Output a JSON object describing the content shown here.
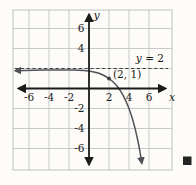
{
  "figure": {
    "asymptote_label_var": "y",
    "asymptote_label_eq": "= 2",
    "end_marker_icon": "black-square"
  },
  "colors": {
    "background": "#fdfcf9",
    "grid": "#c8c9cc",
    "axis": "#1b1b1b",
    "curve": "#515257",
    "asymptote": "#3c3c3c",
    "end_marker": "#242424"
  },
  "chart_data": {
    "type": "line",
    "title": "",
    "xlabel": "x",
    "ylabel": "y",
    "xlim": [
      -7.6,
      8.3
    ],
    "ylim": [
      -8.2,
      7.9
    ],
    "grid": true,
    "grid_step": 2,
    "x_ticks": [
      -6,
      -4,
      -2,
      2,
      4,
      6
    ],
    "y_ticks": [
      6,
      4,
      -2,
      -4,
      -6
    ],
    "asymptote": {
      "y": 2,
      "style": "dashed",
      "label": "y = 2"
    },
    "marked_point": {
      "x": 2,
      "y": 1,
      "label": "(2, 1)"
    },
    "series": [
      {
        "name": "curve",
        "description": "decreasing exponential-type curve, horizontal asymptote y = 2 on the left, through (2, 1), x-intercept near x = 3, arrow down near (5.3, -7.5)",
        "points": [
          [
            -7.35,
            1.78
          ],
          [
            -6.5,
            1.8
          ],
          [
            -5.5,
            1.82
          ],
          [
            -4.5,
            1.84
          ],
          [
            -3.5,
            1.85
          ],
          [
            -2.5,
            1.86
          ],
          [
            -1.5,
            1.84
          ],
          [
            -1,
            1.82
          ],
          [
            -0.5,
            1.79
          ],
          [
            0,
            1.74
          ],
          [
            0.5,
            1.65
          ],
          [
            1,
            1.52
          ],
          [
            1.5,
            1.3
          ],
          [
            2,
            1.0
          ],
          [
            2.4,
            0.68
          ],
          [
            2.8,
            0.25
          ],
          [
            3.1,
            -0.17
          ],
          [
            3.4,
            -0.67
          ],
          [
            3.7,
            -1.28
          ],
          [
            4,
            -2.0
          ],
          [
            4.3,
            -2.88
          ],
          [
            4.6,
            -3.97
          ],
          [
            4.85,
            -5.05
          ],
          [
            5.05,
            -6.05
          ],
          [
            5.2,
            -6.95
          ],
          [
            5.28,
            -7.45
          ]
        ]
      }
    ]
  }
}
